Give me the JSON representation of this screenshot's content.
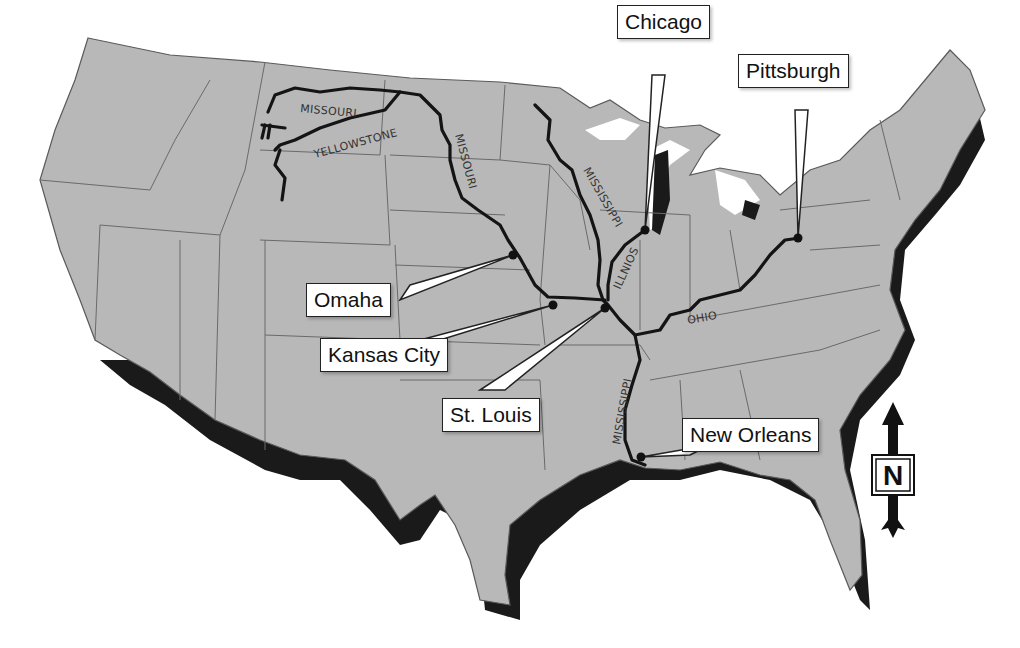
{
  "map": {
    "title": "",
    "region": "Contiguous United States",
    "colors": {
      "land": "#b8b8b8",
      "shadow": "#1a1a1a",
      "border": "#6a6a6a",
      "river": "#141414",
      "background": "#ffffff",
      "callout_bg": "#ffffff"
    }
  },
  "cities": [
    {
      "name": "Chicago",
      "dot": [
        645,
        230
      ]
    },
    {
      "name": "Pittsburgh",
      "dot": [
        798,
        238
      ]
    },
    {
      "name": "Omaha",
      "dot": [
        513,
        255
      ]
    },
    {
      "name": "Kansas City",
      "dot": [
        553,
        305
      ]
    },
    {
      "name": "St. Louis",
      "dot": [
        605,
        308
      ]
    },
    {
      "name": "New Orleans",
      "dot": [
        641,
        457
      ]
    }
  ],
  "rivers": [
    {
      "name": "MISSOURI",
      "label_pos": "north of Yellowstone"
    },
    {
      "name": "YELLOWSTONE"
    },
    {
      "name": "MISSOURI",
      "label_pos": "Dakotas"
    },
    {
      "name": "MISSISSIPPI",
      "label_pos": "upper"
    },
    {
      "name": "ILLNIOS"
    },
    {
      "name": "OHIO"
    },
    {
      "name": "MISSISSIPPI",
      "label_pos": "lower"
    }
  ],
  "compass": {
    "letter": "N",
    "direction": "north"
  }
}
